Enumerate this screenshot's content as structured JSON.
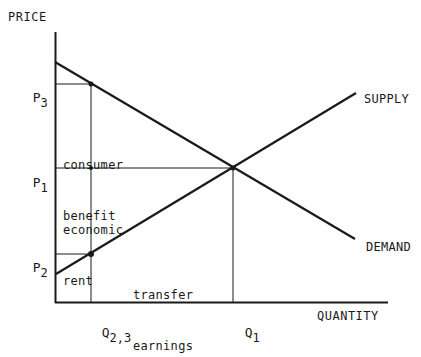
{
  "axes": {
    "y_title": "PRICE",
    "x_title": "QUANTITY"
  },
  "price_levels": [
    {
      "id": "p3",
      "letter": "P",
      "sub": "3"
    },
    {
      "id": "p1",
      "letter": "P",
      "sub": "1"
    },
    {
      "id": "p2",
      "letter": "P",
      "sub": "2"
    }
  ],
  "quantity_levels": [
    {
      "id": "q23",
      "letter": "Q",
      "sub": "2,3"
    },
    {
      "id": "q1",
      "letter": "Q",
      "sub": "1"
    }
  ],
  "curves": {
    "supply": "SUPPLY",
    "demand": "DEMAND"
  },
  "regions": {
    "consumer_benefit": [
      "consumer",
      "benefit"
    ],
    "economic_rent": [
      "economic",
      "rent"
    ],
    "transfer_earnings": [
      "transfer",
      "earnings"
    ]
  },
  "colors": {
    "ink": "#1a1a1a",
    "background": "#ffffff"
  }
}
